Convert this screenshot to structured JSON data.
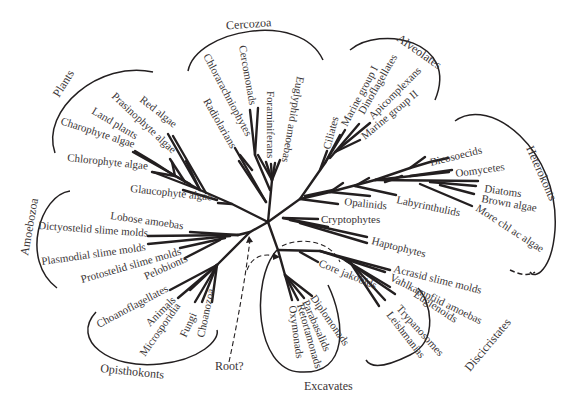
{
  "diagram": {
    "type": "unrooted phylogenetic tree of eukaryotes",
    "root_label": "Root?",
    "groups": {
      "cercozoa": "Cercozoa",
      "alveolates": "Alveolates",
      "heterokonts": "Heterokonts",
      "plants": "Plants",
      "amoebozoa": "Amoebozoa",
      "opisthokonts": "Opisthokonts",
      "excavates": "Excavates",
      "discicristates": "Discicristates"
    },
    "taxa": {
      "plants": [
        "Red algae",
        "Prasinophyte algae",
        "Land plants",
        "Charophyte algae",
        "Chlorophyte algae",
        "Glaucophyte algae"
      ],
      "cercozoa": [
        "Chlorarachniophytes",
        "Cercomonads",
        "Radiolarians",
        "Foraminiferans",
        "Euglyphid amoebas"
      ],
      "alveolates": [
        "Ciliates",
        "Marine group I",
        "Dinoflagellates",
        "Apicomplexans",
        "Marine group II"
      ],
      "heterokonts": [
        "Bicosoecids",
        "Oomycetes",
        "Diatoms",
        "Brown algae",
        "More chl ac algae",
        "Opalinids",
        "Labyrinthulids"
      ],
      "other": [
        "Cryptophytes",
        "Haptophytes"
      ],
      "amoebozoa": [
        "Lobose amoebas",
        "Dictyostelid slime molds",
        "Plasmodial slime molds",
        "Protostelid slime molds",
        "Pelobionts"
      ],
      "opisthokonts": [
        "Choanoflagellates",
        "Animals",
        "Microsporidia",
        "Fungi",
        "Choanozoa"
      ],
      "excavates": [
        "Core jakobids",
        "Diplomonads",
        "Parabasalids",
        "Retortamonads",
        "Oxymonads"
      ],
      "discicristates": [
        "Acrasid slime molds",
        "Vahlkampfiid amoebas",
        "Euglenoids",
        "Trypanosomes",
        "Leishmanias"
      ]
    }
  }
}
